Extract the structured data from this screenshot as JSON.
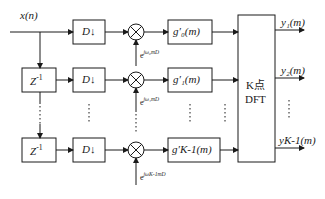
{
  "diagram": {
    "type": "polyphase DFT filter bank block diagram",
    "input": {
      "label": "x(n)"
    },
    "delay_blocks": [
      {
        "label": "Z",
        "sup": "-1"
      },
      {
        "label": "Z",
        "sup": "-1"
      }
    ],
    "decimators": [
      {
        "label": "D↓"
      },
      {
        "label": "D↓"
      },
      {
        "label": "D↓"
      }
    ],
    "multipliers": [
      {
        "exp_label": "e",
        "exp_sup": "jω₀mD"
      },
      {
        "exp_label": "e",
        "exp_sup": "jω₁mD"
      },
      {
        "exp_label": "e",
        "exp_sup": "jωK-1mD"
      }
    ],
    "filters": [
      {
        "label": "g′₀(m)"
      },
      {
        "label": "g′₁(m)"
      },
      {
        "label": "g′K-1(m)"
      }
    ],
    "dft": {
      "line1": "K点",
      "line2": "DFT"
    },
    "outputs": [
      {
        "label": "y₁(m)"
      },
      {
        "label": "y₂(m)"
      },
      {
        "label": "yK-1(m)"
      }
    ],
    "ellipsis": "⋮",
    "colors": {
      "stroke": "#1a1a1a",
      "background": "#ffffff"
    }
  }
}
